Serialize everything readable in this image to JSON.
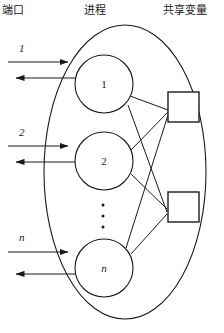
{
  "diagram": {
    "headers": {
      "ports": "端口",
      "process": "进程",
      "shared": "共享变量"
    },
    "stroke_color": "#1a1a1a",
    "fill_color": "#ffffff",
    "boundary": {
      "shape": "ellipse",
      "cx": 125,
      "cy": 172,
      "rx": 81,
      "ry": 147
    },
    "processes": [
      {
        "label": "1",
        "cx": 104,
        "cy": 84,
        "r": 29,
        "italic": false
      },
      {
        "label": "2",
        "cx": 104,
        "cy": 161,
        "r": 29,
        "italic": false
      },
      {
        "label": "n",
        "cx": 104,
        "cy": 268,
        "r": 29,
        "italic": true
      }
    ],
    "vertical_ellipsis": {
      "count": 3,
      "cx": 103,
      "cy_start": 205,
      "spacing": 11
    },
    "shared_variables": [
      {
        "name": "shared-variable-box-1",
        "x": 168,
        "y": 92,
        "w": 31,
        "h": 30
      },
      {
        "name": "shared-variable-box-2",
        "x": 168,
        "y": 192,
        "w": 31,
        "h": 30
      }
    ],
    "ports": [
      {
        "label": "1",
        "label_x": 19,
        "label_y": 42,
        "in_y": 62,
        "out_y": 78,
        "in_x_start": 8,
        "in_x_end": 77,
        "out_x_start": 77,
        "out_x_end": 7
      },
      {
        "label": "2",
        "label_x": 19,
        "label_y": 126,
        "in_y": 146,
        "out_y": 162,
        "in_x_start": 8,
        "in_x_end": 77,
        "out_x_start": 77,
        "out_x_end": 7
      },
      {
        "label": "n",
        "label_x": 19,
        "label_y": 231,
        "in_y": 252,
        "out_y": 274,
        "in_x_start": 8,
        "in_x_end": 77,
        "out_x_start": 77,
        "out_x_end": 7
      }
    ],
    "connections": [
      {
        "from": "process-1",
        "to": "shared-variable-box-1",
        "x1": 130,
        "y1": 96,
        "x2": 168,
        "y2": 110
      },
      {
        "from": "process-1",
        "to": "shared-variable-box-2",
        "x1": 128,
        "y1": 104,
        "x2": 168,
        "y2": 212
      },
      {
        "from": "process-2",
        "to": "shared-variable-box-1",
        "x1": 131,
        "y1": 150,
        "x2": 168,
        "y2": 112
      },
      {
        "from": "process-2",
        "to": "shared-variable-box-2",
        "x1": 131,
        "y1": 173,
        "x2": 168,
        "y2": 210
      },
      {
        "from": "process-n",
        "to": "shared-variable-box-1",
        "x1": 127,
        "y1": 248,
        "x2": 168,
        "y2": 114
      },
      {
        "from": "process-n",
        "to": "shared-variable-box-2",
        "x1": 130,
        "y1": 253,
        "x2": 168,
        "y2": 214
      }
    ]
  }
}
